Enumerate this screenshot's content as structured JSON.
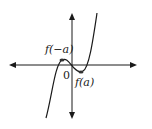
{
  "diagram": {
    "type": "function-graph",
    "labels": {
      "local_max": "f(−a)",
      "local_min": "f(a)",
      "origin": "0"
    },
    "colors": {
      "curve": "#1a1a1a",
      "axes": "#1a1a1a",
      "points": "#333333",
      "background": "#ffffff"
    }
  }
}
